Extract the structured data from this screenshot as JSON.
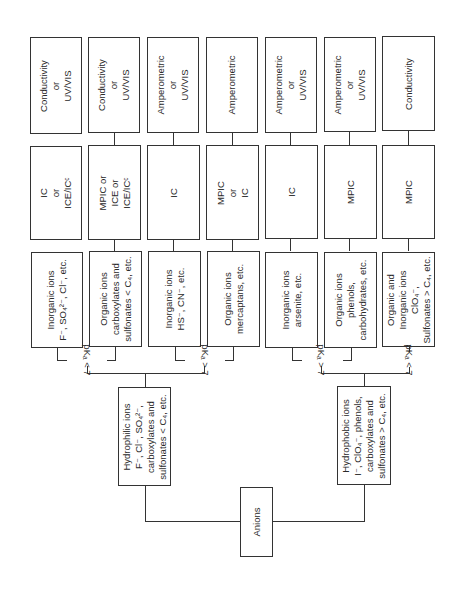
{
  "root": {
    "label": "Anions"
  },
  "groups": [
    {
      "id": "hydrophilic",
      "lines": [
        "Hydrophilic ions",
        "F⁻, Cl⁻, SO₄²⁻,",
        "carboxylates and",
        "sulfonates < C₄, etc."
      ],
      "branches": [
        {
          "condition": "pKₐ < 7",
          "ions": [
            "Inorganic ions",
            "F⁻, SO₄²⁻, Cl⁻, etc."
          ],
          "method": [
            "IC",
            "or",
            "ICE/ICᶜ"
          ],
          "detector": [
            "Conductivity",
            "or",
            "UV/VIS"
          ]
        },
        {
          "condition": "pKₐ < 7",
          "ions": [
            "Organic ions",
            "carboxylates and",
            "sulfonates < C₄, etc."
          ],
          "method": [
            "MPIC or",
            "ICE or",
            "ICE/ICᶜ"
          ],
          "detector": [
            "Conductivity",
            "or",
            "UV/VIS"
          ]
        },
        {
          "condition": "pKₐ > 7",
          "ions": [
            "Inorganic ions",
            "HS⁻, CN⁻, etc."
          ],
          "method": [
            "IC"
          ],
          "detector": [
            "Amperometric",
            "or",
            "UV/VIS"
          ]
        },
        {
          "condition": "pKₐ > 7",
          "ions": [
            "Organic ions",
            "mercaptans, etc."
          ],
          "method": [
            "MPIC",
            "or",
            "IC"
          ],
          "detector": [
            "Amperometric"
          ]
        }
      ]
    },
    {
      "id": "hydrophobic",
      "lines": [
        "Hydrophobic ions",
        "I⁻, ClO₄⁻, phenols,",
        "carboxylates and",
        "sulfonates > C₄, etc."
      ],
      "branches": [
        {
          "condition": "pKₐ > 7",
          "ions": [
            "Inorganic ions",
            "arsenite, etc."
          ],
          "method": [
            "IC"
          ],
          "detector": [
            "Amperometric",
            "or",
            "UV/VIS"
          ]
        },
        {
          "condition": "pKₐ > 7",
          "ions": [
            "Organic ions",
            "phenols,",
            "carbohydrates, etc."
          ],
          "method": [
            "MPIC"
          ],
          "detector": [
            "Amperometric",
            "or",
            "UV/VIS"
          ]
        },
        {
          "condition": "pKₐ < 7",
          "ions": [
            "Organic and",
            "Inorganic ions",
            "ClO₄⁻,",
            "Sulfonates > C₄, etc."
          ],
          "method": [
            "MPIC"
          ],
          "detector": [
            "Conductivity"
          ]
        }
      ]
    }
  ],
  "labels": {
    "pka_lt7": "pKₐ < 7",
    "pka_gt7": "pKₐ > 7"
  }
}
